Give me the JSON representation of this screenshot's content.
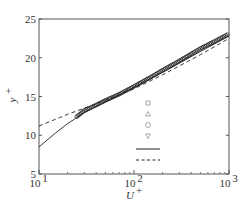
{
  "chart_data": {
    "type": "line",
    "title": "",
    "xlabel": "U+",
    "ylabel": "y+",
    "xscale": "log",
    "xlim": [
      10,
      1000
    ],
    "ylim": [
      5,
      25
    ],
    "x_ticks": [
      "10^1",
      "10^2",
      "10^3"
    ],
    "y_ticks": [
      "5",
      "10",
      "15",
      "20",
      "25"
    ],
    "grid": false,
    "legend_position": "lower right inside",
    "legend": [
      {
        "marker": "square",
        "label": ""
      },
      {
        "marker": "triangle-up",
        "label": ""
      },
      {
        "marker": "circle",
        "label": ""
      },
      {
        "marker": "triangle-down",
        "label": ""
      },
      {
        "line": "solid",
        "label": ""
      },
      {
        "line": "dashed",
        "label": ""
      }
    ],
    "series": [
      {
        "name": "solid",
        "style": "solid",
        "x": [
          10,
          15,
          20,
          30,
          50,
          100,
          200,
          500,
          1000
        ],
        "y": [
          8.5,
          10.3,
          11.5,
          12.9,
          14.3,
          16.2,
          18.1,
          20.8,
          22.8
        ]
      },
      {
        "name": "dashed",
        "style": "dashed",
        "x": [
          10,
          20,
          50,
          100,
          200,
          500,
          1000
        ],
        "y": [
          11.2,
          12.7,
          14.5,
          16.0,
          17.8,
          20.4,
          22.5
        ]
      },
      {
        "name": "markers",
        "style": "markers",
        "x": [
          25,
          30,
          40,
          50,
          70,
          100,
          150,
          200,
          300,
          500,
          700,
          1000
        ],
        "y": [
          12.4,
          13.2,
          13.9,
          14.5,
          15.3,
          16.3,
          17.5,
          18.4,
          19.6,
          21.2,
          22.1,
          23.1
        ]
      }
    ]
  },
  "axes": {
    "xlabel": "U",
    "xlabel_sup": "+",
    "ylabel": "y",
    "ylabel_sup": "+",
    "xticks": [
      {
        "base": "10",
        "exp": "1"
      },
      {
        "base": "10",
        "exp": "2"
      },
      {
        "base": "10",
        "exp": "3"
      }
    ],
    "yticks": [
      "5",
      "10",
      "15",
      "20",
      "25"
    ]
  }
}
